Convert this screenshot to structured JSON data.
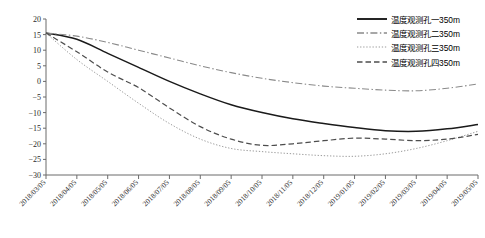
{
  "chart_data": {
    "type": "line",
    "title": "",
    "xlabel": "日期",
    "ylabel": "温度/℃",
    "ylim": [
      -30,
      20
    ],
    "yticks": [
      20,
      15,
      10,
      5,
      0,
      -5,
      -10,
      -15,
      -20,
      -25,
      -30
    ],
    "grid": false,
    "legend_position": "top-right",
    "x": [
      "2018/03/05",
      "2018/04/05",
      "2018/05/05",
      "2018/06/05",
      "2018/07/05",
      "2018/08/05",
      "2018/09/05",
      "2018/10/05",
      "2018/11/05",
      "2018/12/05",
      "2019/01/05",
      "2019/02/05",
      "2019/03/05",
      "2019/04/05",
      "2019/05/05"
    ],
    "series": [
      {
        "name": "温度观测孔一350m",
        "style": "solid",
        "color": "#1a1a1a",
        "values": [
          15.5,
          13.5,
          9.0,
          4.5,
          0.0,
          -4.0,
          -7.5,
          -10.0,
          -12.0,
          -13.5,
          -14.8,
          -15.8,
          -16.0,
          -15.2,
          -13.8
        ]
      },
      {
        "name": "温度观测孔二350m",
        "style": "dashdot",
        "color": "#8a8a8a",
        "values": [
          15.5,
          14.5,
          12.5,
          10.0,
          7.5,
          5.0,
          2.8,
          1.0,
          -0.4,
          -1.5,
          -2.2,
          -2.8,
          -3.0,
          -2.2,
          -0.8
        ]
      },
      {
        "name": "温度观测孔三350m",
        "style": "dotted",
        "color": "#9a9a9a",
        "values": [
          15.5,
          7.0,
          0.0,
          -7.0,
          -13.5,
          -18.5,
          -21.5,
          -22.5,
          -23.2,
          -23.8,
          -24.0,
          -23.2,
          -21.5,
          -19.0,
          -16.0
        ]
      },
      {
        "name": "温度观测孔四350m",
        "style": "dashed",
        "color": "#4d4d4d",
        "values": [
          15.5,
          9.5,
          3.0,
          -2.0,
          -8.5,
          -14.5,
          -18.5,
          -20.5,
          -20.0,
          -19.0,
          -18.2,
          -18.5,
          -19.0,
          -18.5,
          -17.0
        ]
      }
    ]
  }
}
